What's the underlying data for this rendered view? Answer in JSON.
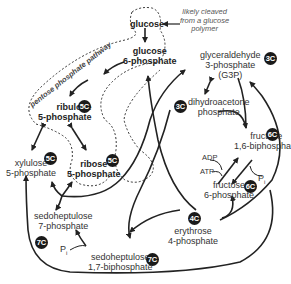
{
  "pathway_label": "pentose phosphate pathway",
  "note": [
    "likely cleaved",
    "from a glucose",
    "polymer"
  ],
  "nodes": {
    "glucose": {
      "label": [
        "glucose"
      ]
    },
    "g6p": {
      "label": [
        "glucose",
        "6-phosphate"
      ]
    },
    "ru5p": {
      "label": [
        "ribulose",
        "5-phosphate"
      ],
      "badge": "5C"
    },
    "r5p": {
      "label": [
        "ribose",
        "5-phosphate"
      ],
      "badge": "5C"
    },
    "xu5p": {
      "label": [
        "xylulose",
        "5-phosphate"
      ],
      "badge": "5C"
    },
    "g3p": {
      "label": [
        "glyceraldehyde",
        "3-phosphate",
        "(G3P)"
      ],
      "badge": "3C"
    },
    "dhap": {
      "label": [
        "dihydroacetone",
        "phosphate"
      ],
      "badge": "3C"
    },
    "f16bp": {
      "label": [
        "fructose",
        "1,6-biphosphate"
      ],
      "badge": "6C"
    },
    "f6p": {
      "label": [
        "fructose",
        "6-phosphate"
      ],
      "badge": "6C"
    },
    "e4p": {
      "label": [
        "erythrose",
        "4-phosphate"
      ],
      "badge": "4C"
    },
    "s7p": {
      "label": [
        "sedoheptulose",
        "7-phosphate"
      ],
      "badge": "7C"
    },
    "s17bp": {
      "label": [
        "sedoheptulose",
        "1,7-biphosphate"
      ],
      "badge": "7C"
    }
  },
  "cofactors": {
    "adp": "ADP",
    "atp": "ATP",
    "pi1": "P",
    "pi1_sub": "i",
    "pi2": "P",
    "pi2_sub": "i"
  }
}
